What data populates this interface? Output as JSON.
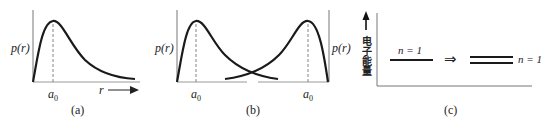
{
  "panels": {
    "a": {
      "caption": "(a)",
      "y_label": "p(r)",
      "peak_label": "a",
      "peak_sub": "0",
      "x_label": "r"
    },
    "b": {
      "caption": "(b)",
      "y_label": "p(r)",
      "left_peak_label": "a",
      "left_peak_sub": "0",
      "right_peak_label": "a",
      "right_peak_sub": "0"
    },
    "c": {
      "caption": "(c)",
      "y_label": "电子能量",
      "left_level_label": "n = 1",
      "arrow": "⇒",
      "right_level_label": "n = 1"
    }
  },
  "colors": {
    "line": "#1a1a1a",
    "axis": "#555555",
    "dashed": "#666666"
  }
}
